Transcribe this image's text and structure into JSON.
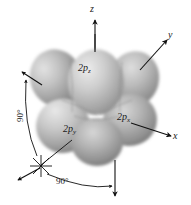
{
  "figure": {
    "kind": "atomic-orbital-diagram",
    "background_color": "#ffffff",
    "lobe_color": "#9a9a9a",
    "lobe_highlight_color": "#d8d8d8",
    "lobe_shadow_color": "#6e6e6e",
    "line_color": "#1a1a1a"
  },
  "axes": [
    {
      "id": "z",
      "label": "z",
      "direction": "up"
    },
    {
      "id": "y",
      "label": "y",
      "direction": "upper-right"
    },
    {
      "id": "x",
      "label": "x",
      "direction": "lower-right"
    }
  ],
  "orbitals": [
    {
      "id": "2pz",
      "label": "2p",
      "subscript": "z"
    },
    {
      "id": "2py",
      "label": "2p",
      "subscript": "y"
    },
    {
      "id": "2px",
      "label": "2p",
      "subscript": "x"
    }
  ],
  "annotations": [
    {
      "id": "angle-left",
      "label": "90°",
      "note": "angle between z axis and the lower-left reference direction"
    },
    {
      "id": "angle-bottom",
      "label": "90°",
      "note": "angle between lower-left reference direction and the downward axis"
    }
  ],
  "markers": [
    {
      "id": "axis-origin-star",
      "note": "asterisk/star marker at the lower-left where reference lines converge"
    }
  ]
}
